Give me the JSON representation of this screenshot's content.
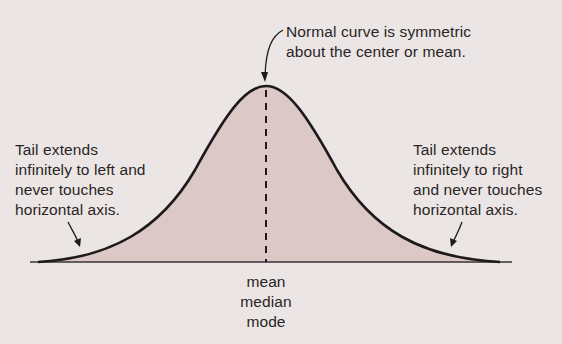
{
  "diagram": {
    "colors": {
      "background": "#ebe6e5",
      "fill": "#dcc8c6",
      "curve": "#1e1a1a",
      "text": "#2a2424"
    },
    "annotations": {
      "top": {
        "line1": "Normal curve is symmetric",
        "line2": "about the center or mean."
      },
      "left_tail": {
        "line1": "Tail extends",
        "line2": "infinitely to left and",
        "line3": "never touches",
        "line4": "horizontal axis."
      },
      "right_tail": {
        "line1": "Tail extends",
        "line2": "infinitely to right",
        "line3": "and never touches",
        "line4": "horizontal axis."
      },
      "center_labels": {
        "line1": "mean",
        "line2": "median",
        "line3": "mode"
      }
    }
  }
}
